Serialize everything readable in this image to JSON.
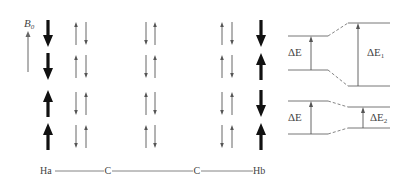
{
  "field": {
    "label": "B",
    "subscript": "0"
  },
  "molecule": {
    "atoms": [
      "Ha",
      "C",
      "C",
      "Hb"
    ]
  },
  "spin_columns": [
    {
      "name": "Ha",
      "type": "bold",
      "rows": [
        [
          "down"
        ],
        [
          "down"
        ],
        [
          "up"
        ],
        [
          "up"
        ]
      ]
    },
    {
      "name": "C1-pair",
      "type": "pair",
      "rows": [
        [
          "up",
          "down"
        ],
        [
          "up",
          "down"
        ],
        [
          "down",
          "up"
        ],
        [
          "down",
          "up"
        ]
      ]
    },
    {
      "name": "C2-pair",
      "type": "pair",
      "rows": [
        [
          "down",
          "up"
        ],
        [
          "down",
          "up"
        ],
        [
          "up",
          "down"
        ],
        [
          "up",
          "down"
        ]
      ]
    },
    {
      "name": "C3-pair",
      "type": "pair",
      "rows": [
        [
          "up",
          "down"
        ],
        [
          "up",
          "down"
        ],
        [
          "down",
          "up"
        ],
        [
          "down",
          "up"
        ]
      ]
    },
    {
      "name": "Hb",
      "type": "bold",
      "rows": [
        [
          "down"
        ],
        [
          "up"
        ],
        [
          "down"
        ],
        [
          "up"
        ]
      ]
    }
  ],
  "energy_diagram": {
    "top": {
      "left_label": "ΔE",
      "right_label": "ΔE",
      "right_subscript": "1"
    },
    "bottom": {
      "left_label": "ΔE",
      "right_label": "ΔE",
      "right_subscript": "2"
    }
  },
  "colors": {
    "bold_arrow": "#111111",
    "thin_arrow": "#555555",
    "line": "#555555",
    "text": "#444444"
  }
}
